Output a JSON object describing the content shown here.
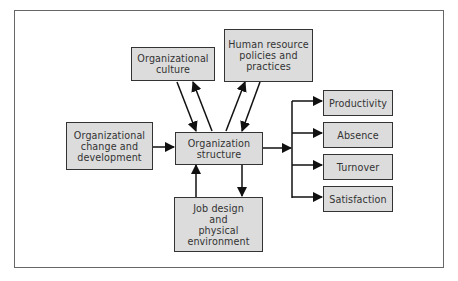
{
  "diagram": {
    "nodes": {
      "culture": {
        "label": "Organizational\nculture"
      },
      "hr": {
        "label": "Human resource\npolicies and\npractices"
      },
      "change": {
        "label": "Organizational\nchange and\ndevelopment"
      },
      "structure": {
        "label": "Organization\nstructure"
      },
      "job_design": {
        "label": "Job design\nand\nphysical\nenvironment"
      },
      "productivity": {
        "label": "Productivity"
      },
      "absence": {
        "label": "Absence"
      },
      "turnover": {
        "label": "Turnover"
      },
      "satisfaction": {
        "label": "Satisfaction"
      }
    },
    "edges": [
      {
        "from": "culture",
        "to": "structure"
      },
      {
        "from": "structure",
        "to": "culture"
      },
      {
        "from": "hr",
        "to": "structure"
      },
      {
        "from": "structure",
        "to": "hr"
      },
      {
        "from": "change",
        "to": "structure"
      },
      {
        "from": "job_design",
        "to": "structure"
      },
      {
        "from": "structure",
        "to": "job_design"
      },
      {
        "from": "structure",
        "to": "productivity"
      },
      {
        "from": "structure",
        "to": "absence"
      },
      {
        "from": "structure",
        "to": "turnover"
      },
      {
        "from": "structure",
        "to": "satisfaction"
      }
    ],
    "colors": {
      "box_fill": "#dcdcdc",
      "box_border": "#333333",
      "arrow": "#111111",
      "frame": "#666666"
    }
  }
}
